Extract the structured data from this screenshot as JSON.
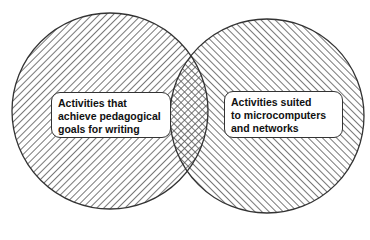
{
  "diagram": {
    "type": "venn",
    "sets": [
      {
        "id": "left",
        "lines": [
          "Activities that",
          "achieve pedagogical",
          "goals for writing"
        ],
        "hatch": "backslash"
      },
      {
        "id": "right",
        "lines": [
          "Activities suited",
          "to microcomputers",
          "and networks"
        ],
        "hatch": "forward-slash"
      }
    ],
    "intersection": {
      "hatch": "crosshatch"
    },
    "colors": {
      "line": "#333333",
      "hatch": "#555555",
      "background": "#ffffff"
    }
  }
}
